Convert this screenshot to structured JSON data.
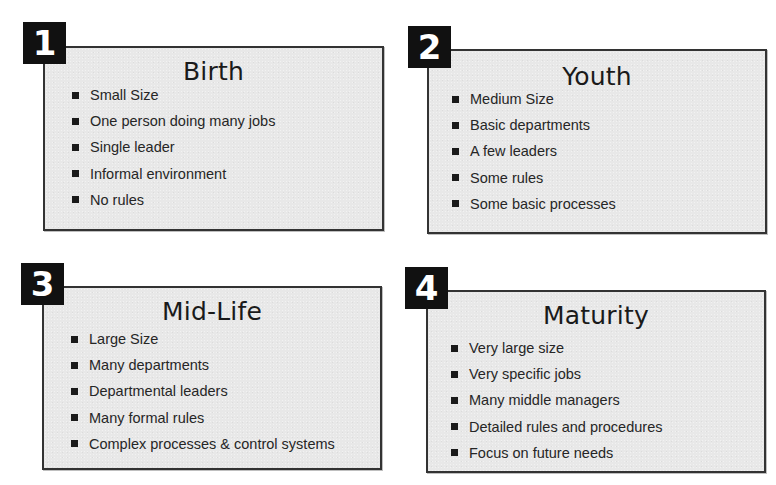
{
  "diagram": {
    "stages": [
      {
        "number": "1",
        "title": "Birth",
        "items": [
          "Small Size",
          "One person doing many jobs",
          "Single leader",
          "Informal environment",
          "No rules"
        ]
      },
      {
        "number": "2",
        "title": "Youth",
        "items": [
          "Medium Size",
          "Basic departments",
          "A few leaders",
          "Some rules",
          "Some basic processes"
        ]
      },
      {
        "number": "3",
        "title": "Mid-Life",
        "items": [
          "Large Size",
          "Many departments",
          "Departmental leaders",
          "Many formal rules",
          "Complex processes & control systems"
        ]
      },
      {
        "number": "4",
        "title": "Maturity",
        "items": [
          "Very large size",
          "Very specific jobs",
          "Many middle managers",
          "Detailed rules and procedures",
          "Focus on future needs"
        ]
      }
    ],
    "colors": {
      "badge_background": "#111111",
      "badge_text": "#ffffff",
      "box_fill": "#e8e8e8",
      "box_border": "#333333",
      "text": "#1e1e1e"
    }
  }
}
